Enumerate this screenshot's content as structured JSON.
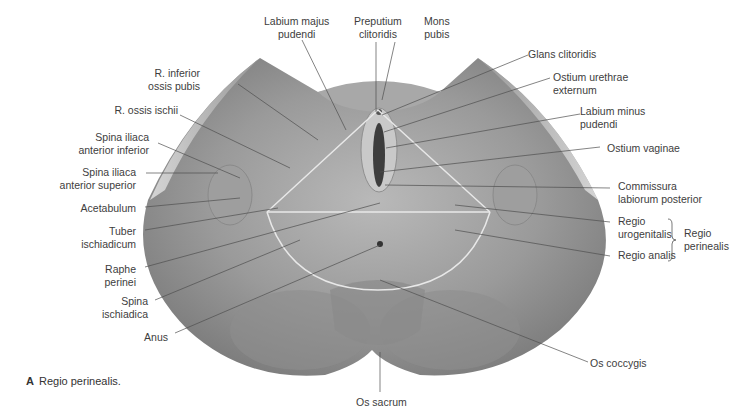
{
  "figure": {
    "caption_letter": "A",
    "caption_text": "Regio perinealis.",
    "colors": {
      "background": "#ffffff",
      "silhouette": "#8a8a8a",
      "leader_line": "#555555",
      "region_outline": "#e6e6e6",
      "label_text": "#3d3d3d"
    }
  },
  "labels": {
    "top": {
      "labium_majus_1": "Labium majus",
      "labium_majus_2": "pudendi",
      "preputium_1": "Preputium",
      "preputium_2": "clitoridis",
      "mons_1": "Mons",
      "mons_2": "pubis"
    },
    "left": {
      "r_inferior_1": "R. inferior",
      "r_inferior_2": "ossis pubis",
      "r_ossis_ischii": "R. ossis ischii",
      "spina_inf_1": "Spina iliaca",
      "spina_inf_2": "anterior inferior",
      "spina_sup_1": "Spina iliaca",
      "spina_sup_2": "anterior superior",
      "acetabulum": "Acetabulum",
      "tuber_1": "Tuber",
      "tuber_2": "ischiadicum",
      "raphe_1": "Raphe",
      "raphe_2": "perinei",
      "spina_isch_1": "Spina",
      "spina_isch_2": "ischiadica",
      "anus": "Anus"
    },
    "right": {
      "glans": "Glans clitoridis",
      "ostium_ureth_1": "Ostium urethrae",
      "ostium_ureth_2": "externum",
      "labium_minus_1": "Labium minus",
      "labium_minus_2": "pudendi",
      "ostium_vag": "Ostium vaginae",
      "commissura_1": "Commissura",
      "commissura_2": "labiorum posterior",
      "regio_uro_1": "Regio",
      "regio_uro_2": "urogenitalis",
      "regio_analis": "Regio analis",
      "regio_perin_1": "Regio",
      "regio_perin_2": "perinealis",
      "os_coccygis": "Os coccygis"
    },
    "bottom": {
      "os_sacrum": "Os sacrum"
    }
  }
}
